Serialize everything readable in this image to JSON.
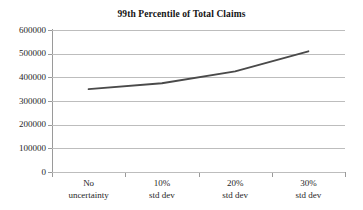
{
  "chart_data": {
    "type": "line",
    "title": "99th Percentile of Total Claims",
    "xlabel": "",
    "ylabel": "",
    "categories": [
      "No uncertainty",
      "10% std dev",
      "20% std dev",
      "30% std dev"
    ],
    "category_lines": [
      [
        "No",
        "uncertainty"
      ],
      [
        "10%",
        "std dev"
      ],
      [
        "20%",
        "std dev"
      ],
      [
        "30%",
        "std dev"
      ]
    ],
    "series": [
      {
        "name": "99th Percentile of Total Claims",
        "values": [
          350000,
          375000,
          425000,
          510000
        ]
      }
    ],
    "ylim": [
      0,
      600000
    ],
    "ytick_values": [
      0,
      100000,
      200000,
      300000,
      400000,
      500000,
      600000
    ],
    "ytick_labels": [
      "0",
      "100000",
      "200000",
      "300000",
      "400000",
      "500000",
      "600000"
    ],
    "grid": true,
    "grid_axis": "y",
    "legend": false,
    "legend_position": "none",
    "marker": "none",
    "colors": {
      "line": "#4a4a4a",
      "gridline": "#bdbdbd",
      "axis": "#9a9a9a",
      "text": "#1f1f1f",
      "background": "#ffffff"
    }
  }
}
